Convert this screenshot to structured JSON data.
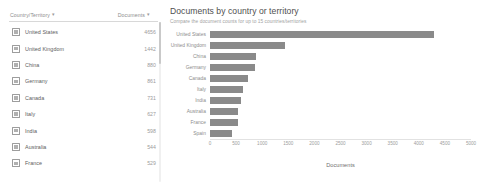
{
  "table": {
    "headers": {
      "country": "Country/Territory",
      "documents": "Documents",
      "sort_icon": "sort-arrow-icon"
    },
    "rows": [
      {
        "name": "United States",
        "value": "4656"
      },
      {
        "name": "United Kingdom",
        "value": "1442"
      },
      {
        "name": "China",
        "value": "880"
      },
      {
        "name": "Germany",
        "value": "861"
      },
      {
        "name": "Canada",
        "value": "731"
      },
      {
        "name": "Italy",
        "value": "627"
      },
      {
        "name": "India",
        "value": "598"
      },
      {
        "name": "Australia",
        "value": "544"
      },
      {
        "name": "France",
        "value": "529"
      }
    ]
  },
  "chart": {
    "title": "Documents by country or territory",
    "subtitle": "Compare the document counts for up to 15 countries/territories"
  },
  "chart_data": {
    "type": "bar",
    "orientation": "horizontal",
    "title": "Documents by country or territory",
    "subtitle": "Compare the document counts for up to 15 countries/territories",
    "xlabel": "Documents",
    "ylabel": "",
    "xlim": [
      0,
      5000
    ],
    "xticks": [
      0,
      500,
      1000,
      1500,
      2000,
      2500,
      3000,
      3500,
      4000,
      4500,
      5000
    ],
    "grid": false,
    "bar_color": "#8a8a8a",
    "legend": null,
    "categories": [
      "United States",
      "United Kingdom",
      "China",
      "Germany",
      "Canada",
      "Italy",
      "India",
      "Australia",
      "France",
      "Spain"
    ],
    "values": [
      4300,
      1440,
      880,
      861,
      731,
      627,
      598,
      544,
      529,
      430
    ]
  }
}
